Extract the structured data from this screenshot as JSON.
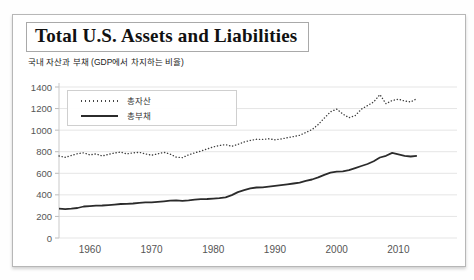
{
  "card": {
    "title": "Total U.S. Assets and Liabilities",
    "subtitle": "국내 자산과 부채 (GDP에서 차지하는 비율)"
  },
  "colors": {
    "assets_line": "#3d3d3d",
    "liabilities_line": "#2b2b2b",
    "grid": "#e5e5e5",
    "axis": "#c9c9c9",
    "tick": "#bbbbbb",
    "label": "#555555"
  },
  "chart_data": {
    "type": "line",
    "title": "Total U.S. Assets and Liabilities",
    "subtitle": "국내 자산과 부채 (GDP에서 차지하는 비율)",
    "xlabel": "",
    "ylabel": "",
    "grid": "horizontal",
    "legend_position": "inside-top-left",
    "xlim": [
      1955,
      2019.5
    ],
    "ylim": [
      0,
      1400
    ],
    "x_ticks": [
      1960,
      1970,
      1980,
      1990,
      2000,
      2010
    ],
    "y_ticks": [
      0,
      200,
      400,
      600,
      800,
      1000,
      1200,
      1400
    ],
    "years_start": 1955,
    "years_end": 2013,
    "series": [
      {
        "name": "총자산",
        "style": "dotted",
        "values": [
          760,
          748,
          765,
          782,
          790,
          770,
          780,
          760,
          775,
          788,
          796,
          780,
          790,
          795,
          780,
          768,
          780,
          795,
          778,
          750,
          745,
          770,
          790,
          806,
          825,
          845,
          858,
          866,
          850,
          868,
          890,
          905,
          915,
          914,
          920,
          910,
          918,
          930,
          940,
          952,
          978,
          1005,
          1052,
          1112,
          1170,
          1195,
          1150,
          1115,
          1135,
          1195,
          1228,
          1262,
          1330,
          1245,
          1275,
          1287,
          1270,
          1262,
          1292
        ]
      },
      {
        "name": "총부채",
        "style": "solid",
        "values": [
          272,
          268,
          272,
          278,
          292,
          296,
          300,
          301,
          305,
          310,
          315,
          316,
          320,
          325,
          330,
          331,
          336,
          340,
          346,
          350,
          345,
          350,
          356,
          360,
          362,
          365,
          369,
          376,
          398,
          426,
          443,
          460,
          468,
          470,
          477,
          483,
          490,
          497,
          505,
          514,
          530,
          542,
          562,
          586,
          606,
          616,
          618,
          629,
          648,
          668,
          686,
          712,
          746,
          762,
          789,
          776,
          762,
          756,
          761
        ]
      }
    ]
  }
}
